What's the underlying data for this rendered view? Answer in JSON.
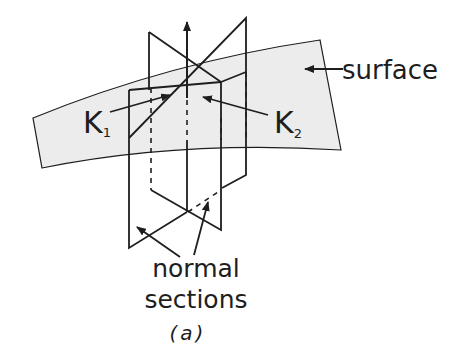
{
  "figure": {
    "caption": "(a)",
    "labels": {
      "surface": "surface",
      "k1_main": "K",
      "k1_sub": "1",
      "k2_main": "K",
      "k2_sub": "2",
      "normal_sections_line1": "normal",
      "normal_sections_line2": "sections"
    },
    "colors": {
      "line": "#1e1e1e",
      "surface_fill": "#ececec",
      "background": "#ffffff"
    }
  }
}
